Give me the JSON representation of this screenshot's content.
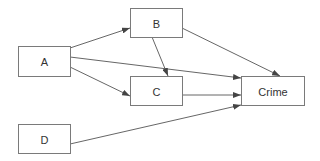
{
  "diagram": {
    "type": "directed-graph",
    "colors": {
      "node_border": "#7a7a7a",
      "edge": "#555555",
      "text": "#333333",
      "background": "#ffffff"
    },
    "nodes": [
      {
        "id": "A",
        "label": "A",
        "x": 18,
        "y": 46,
        "w": 52,
        "h": 30
      },
      {
        "id": "B",
        "label": "B",
        "x": 130,
        "y": 8,
        "w": 52,
        "h": 29
      },
      {
        "id": "C",
        "label": "C",
        "x": 130,
        "y": 76,
        "w": 52,
        "h": 29
      },
      {
        "id": "Crime",
        "label": "Crime",
        "x": 241,
        "y": 76,
        "w": 63,
        "h": 29
      },
      {
        "id": "D",
        "label": "D",
        "x": 18,
        "y": 124,
        "w": 52,
        "h": 29
      }
    ],
    "edges": [
      {
        "from": "A",
        "to": "B",
        "x1": 70,
        "y1": 48,
        "x2": 130,
        "y2": 28
      },
      {
        "from": "A",
        "to": "Crime",
        "x1": 70,
        "y1": 57,
        "x2": 241,
        "y2": 78
      },
      {
        "from": "A",
        "to": "C",
        "x1": 70,
        "y1": 67,
        "x2": 130,
        "y2": 96
      },
      {
        "from": "B",
        "to": "C",
        "x1": 152,
        "y1": 37,
        "x2": 168,
        "y2": 76
      },
      {
        "from": "B",
        "to": "Crime",
        "x1": 182,
        "y1": 28,
        "x2": 280,
        "y2": 76
      },
      {
        "from": "C",
        "to": "Crime",
        "x1": 182,
        "y1": 95,
        "x2": 241,
        "y2": 95
      },
      {
        "from": "D",
        "to": "Crime",
        "x1": 70,
        "y1": 144,
        "x2": 241,
        "y2": 105
      }
    ]
  }
}
